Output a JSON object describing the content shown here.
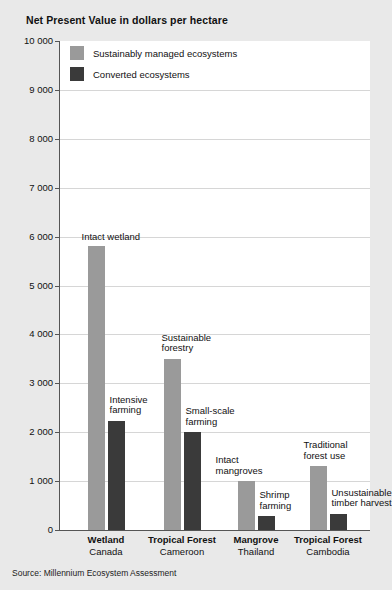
{
  "chart_data": {
    "type": "bar",
    "title": "Net Present Value in dollars per hectare",
    "xlabel": "",
    "ylabel": "",
    "ylim": [
      0,
      10000
    ],
    "ytick_step": 1000,
    "ytick_labels": [
      "10 000",
      "9 000",
      "8 000",
      "7 000",
      "6 000",
      "5 000",
      "4 000",
      "3 000",
      "2 000",
      "1 000",
      "0"
    ],
    "ytick_values": [
      10000,
      9000,
      8000,
      7000,
      6000,
      5000,
      4000,
      3000,
      2000,
      1000,
      0
    ],
    "grid": true,
    "legend_position": "top-left-inside",
    "categories": [
      {
        "name": "Wetland",
        "sub": "Canada"
      },
      {
        "name": "Tropical Forest",
        "sub": "Cameroon"
      },
      {
        "name": "Mangrove",
        "sub": "Thailand"
      },
      {
        "name": "Tropical Forest",
        "sub": "Cambodia"
      }
    ],
    "series": [
      {
        "name": "Sustainably managed ecosystems",
        "color": "#9a9a9a",
        "values": [
          5800,
          3500,
          1000,
          1300
        ],
        "point_labels": [
          "Intact wetland",
          "Sustainable\nforestry",
          "Intact\nmangroves",
          "Traditional\nforest use"
        ]
      },
      {
        "name": "Converted ecosystems",
        "color": "#3a3a3a",
        "values": [
          2230,
          2000,
          280,
          330
        ],
        "point_labels": [
          "Intensive\nfarming",
          "Small-scale\nfarming",
          "Shrimp\nfarming",
          "Unsustainable\ntimber harvest"
        ]
      }
    ],
    "source": "Source: Millennium Ecosystem Assessment"
  }
}
